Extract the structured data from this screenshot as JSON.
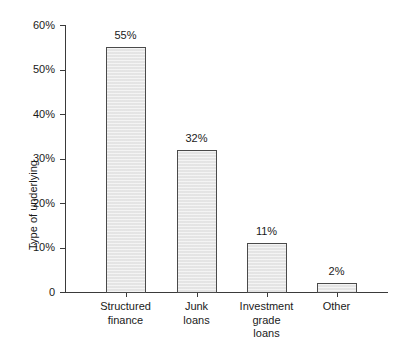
{
  "chart_data": {
    "type": "bar",
    "title": "",
    "subtitle": "",
    "xlabel": "",
    "ylabel": "Type of underlying",
    "categories": [
      "Structured finance",
      "Junk loans",
      "Investment grade loans",
      "Other"
    ],
    "category_lines": [
      [
        "Structured",
        "finance"
      ],
      [
        "Junk",
        "loans"
      ],
      [
        "Investment",
        "grade",
        "loans"
      ],
      [
        "Other"
      ]
    ],
    "values": [
      55,
      32,
      11,
      2
    ],
    "value_labels": [
      "55%",
      "32%",
      "11%",
      "2%"
    ],
    "ylim": [
      0,
      60
    ],
    "y_ticks": [
      0,
      10,
      20,
      30,
      40,
      50,
      60
    ],
    "y_tick_labels": [
      "0",
      "10%",
      "20%",
      "30%",
      "40%",
      "50%",
      "60%"
    ],
    "grid": false,
    "legend": null,
    "legend_position": "none",
    "annotations": [],
    "colors": {
      "bar_fill": "#e7e7e7",
      "bar_border": "#4a4a4a",
      "axis": "#3a3a3a",
      "text": "#1a1a1a",
      "background": "#ffffff"
    }
  }
}
